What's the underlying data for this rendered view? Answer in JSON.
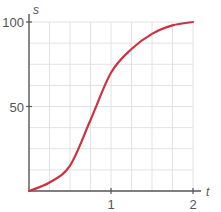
{
  "chart_data": {
    "type": "line",
    "title": "",
    "xlabel": "t",
    "ylabel": "s",
    "xlim": [
      0,
      2
    ],
    "ylim": [
      0,
      100
    ],
    "x_ticks": [
      1,
      2
    ],
    "x_tick_labels": [
      "1",
      "2"
    ],
    "y_ticks": [
      50,
      100
    ],
    "y_tick_labels": [
      "50",
      "100"
    ],
    "grid": true,
    "grid_x_step": 0.25,
    "grid_y_step": 12.5,
    "legend": null,
    "series": [
      {
        "name": "s(t)",
        "color": "#cc3340",
        "x": [
          0,
          0.25,
          0.5,
          0.75,
          1.0,
          1.25,
          1.5,
          1.75,
          2.0
        ],
        "y": [
          0,
          5,
          15,
          42,
          70,
          84,
          93,
          98,
          100
        ]
      }
    ]
  },
  "colors": {
    "axis": "#555555",
    "grid": "#e2e2e2",
    "curve": "#cc3340",
    "text": "#555555"
  },
  "labels": {
    "x_axis_var": "t",
    "y_axis_var": "s",
    "x_tick_1": "1",
    "x_tick_2": "2",
    "y_tick_50": "50",
    "y_tick_100": "100"
  }
}
